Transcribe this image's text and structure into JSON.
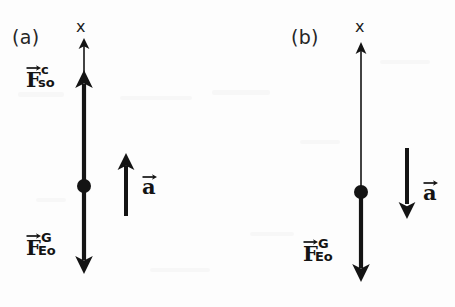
{
  "figure": {
    "background_color": "#fdfdfd",
    "ink_color": "#141414"
  },
  "panels": [
    {
      "id": "a",
      "label": "(a)",
      "axis": {
        "name": "x",
        "direction": "up",
        "label": "x"
      },
      "object_dot": {
        "name": "point-object",
        "radius_px": 7
      },
      "forces": [
        {
          "name": "contact-force",
          "symbol": "F",
          "superscript": "c",
          "subscript": "so",
          "direction": "up",
          "thick": true
        },
        {
          "name": "gravitational-force",
          "symbol": "F",
          "superscript": "G",
          "subscript": "Eo",
          "direction": "down",
          "thick": true
        }
      ],
      "acceleration": {
        "name": "acceleration-vector",
        "symbol": "a",
        "direction": "up"
      }
    },
    {
      "id": "b",
      "label": "(b)",
      "axis": {
        "name": "x",
        "direction": "up",
        "label": "x"
      },
      "object_dot": {
        "name": "point-object",
        "radius_px": 7
      },
      "forces": [
        {
          "name": "gravitational-force",
          "symbol": "F",
          "superscript": "G",
          "subscript": "Eo",
          "direction": "down",
          "thick": true
        }
      ],
      "acceleration": {
        "name": "acceleration-vector",
        "symbol": "a",
        "direction": "down"
      }
    }
  ]
}
